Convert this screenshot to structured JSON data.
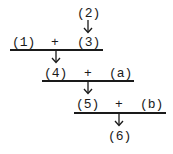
{
  "diagram": {
    "type": "reaction-sequence",
    "nodes": {
      "n1": "(1)",
      "n2": "(2)",
      "n3": "(3)",
      "n4": "(4)",
      "n5": "(5)",
      "n6": "(6)",
      "a": "(a)",
      "b": "(b)"
    },
    "plus": "+",
    "steps": [
      {
        "reactants": [
          "(1)",
          "(3)"
        ],
        "product": "(4)"
      },
      {
        "reactants": [
          "(4)",
          "(a)"
        ],
        "product": "(5)"
      },
      {
        "reactants": [
          "(5)",
          "(b)"
        ],
        "product": "(6)"
      }
    ],
    "edges": [
      {
        "from": "(2)",
        "to": "(3)"
      },
      {
        "from": "(1) + (3)",
        "to": "(4)"
      },
      {
        "from": "(4) + (a)",
        "to": "(5)"
      },
      {
        "from": "(5) + (b)",
        "to": "(6)"
      }
    ],
    "colors": {
      "ink": "#1a1a1a",
      "background": "#ffffff"
    }
  }
}
